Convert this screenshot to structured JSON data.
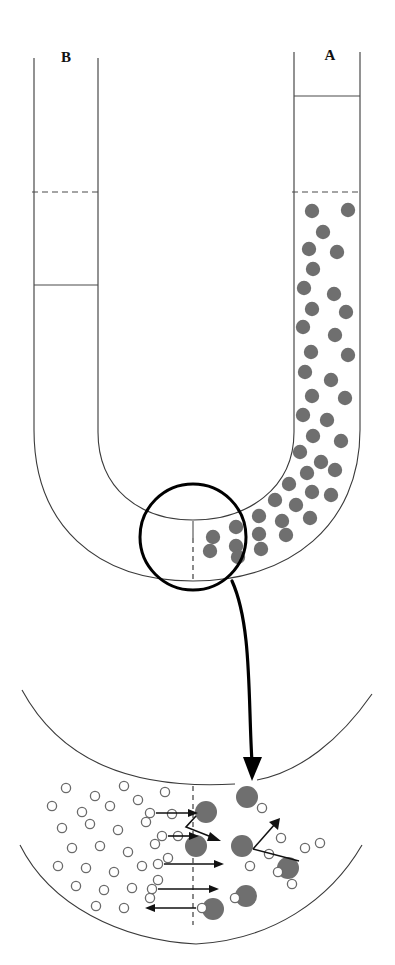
{
  "figure": {
    "type": "diagram",
    "background_color": "#ffffff",
    "line_color": "#3a3a3a",
    "solute_color": "#6f6f6f",
    "solvent_outline_color": "#6a6a6a",
    "callout_color": "#000000"
  },
  "labels": {
    "left_arm": "B",
    "right_arm": "A"
  },
  "tube": {
    "left_arm": {
      "name": "B",
      "outer_wall_x": 34,
      "inner_wall_x": 98,
      "top_y": 58,
      "contents": "pure solvent",
      "solid_level_y": 285,
      "dashed_level_y": 192
    },
    "right_arm": {
      "name": "A",
      "inner_wall_x": 294,
      "outer_wall_x": 360,
      "top_y": 55,
      "contents": "solution with solute",
      "solid_level_y": 96,
      "dashed_level_y": 192
    },
    "dashed_initial_level_y": 192,
    "membrane_x": 193
  },
  "callout": {
    "center_x": 193,
    "center_y": 537,
    "radius": 53,
    "stroke_width": 3
  },
  "detail": {
    "membrane_x": 193,
    "solvent_radius": 4.6,
    "solute_radius": 11,
    "left_side_contents": "solvent molecules (small open circles)",
    "right_side_contents": "solute particles (large filled circles) plus solvent"
  },
  "particles": {
    "solute_tube_a": [
      [
        312,
        211
      ],
      [
        348,
        210
      ],
      [
        323,
        232
      ],
      [
        309,
        249
      ],
      [
        337,
        252
      ],
      [
        313,
        269
      ],
      [
        304,
        288
      ],
      [
        334,
        294
      ],
      [
        312,
        309
      ],
      [
        346,
        312
      ],
      [
        303,
        327
      ],
      [
        335,
        335
      ],
      [
        311,
        352
      ],
      [
        348,
        355
      ],
      [
        305,
        372
      ],
      [
        331,
        380
      ],
      [
        312,
        396
      ],
      [
        345,
        398
      ],
      [
        303,
        415
      ],
      [
        327,
        420
      ],
      [
        313,
        436
      ],
      [
        341,
        441
      ],
      [
        300,
        452
      ],
      [
        321,
        462
      ],
      [
        307,
        473
      ],
      [
        335,
        470
      ],
      [
        289,
        484
      ],
      [
        312,
        492
      ],
      [
        275,
        500
      ],
      [
        296,
        505
      ],
      [
        331,
        495
      ],
      [
        259,
        516
      ],
      [
        282,
        521
      ],
      [
        310,
        518
      ],
      [
        236,
        527
      ],
      [
        259,
        534
      ],
      [
        286,
        535
      ],
      [
        213,
        537
      ],
      [
        236,
        546
      ],
      [
        261,
        549
      ],
      [
        210,
        551
      ],
      [
        238,
        557
      ]
    ],
    "solvent_detail_left": [
      [
        66,
        788
      ],
      [
        95,
        796
      ],
      [
        124,
        786
      ],
      [
        52,
        806
      ],
      [
        82,
        812
      ],
      [
        110,
        806
      ],
      [
        138,
        800
      ],
      [
        165,
        792
      ],
      [
        62,
        828
      ],
      [
        90,
        824
      ],
      [
        118,
        830
      ],
      [
        146,
        822
      ],
      [
        172,
        814
      ],
      [
        72,
        848
      ],
      [
        100,
        846
      ],
      [
        128,
        852
      ],
      [
        155,
        844
      ],
      [
        178,
        836
      ],
      [
        58,
        866
      ],
      [
        86,
        868
      ],
      [
        114,
        872
      ],
      [
        142,
        866
      ],
      [
        168,
        858
      ],
      [
        76,
        886
      ],
      [
        104,
        890
      ],
      [
        132,
        888
      ],
      [
        158,
        880
      ],
      [
        96,
        906
      ],
      [
        124,
        908
      ],
      [
        150,
        898
      ]
    ],
    "solvent_detail_right": [
      [
        262,
        808
      ],
      [
        281,
        838
      ],
      [
        269,
        854
      ],
      [
        305,
        848
      ],
      [
        320,
        843
      ],
      [
        250,
        866
      ],
      [
        278,
        872
      ],
      [
        235,
        898
      ],
      [
        292,
        884
      ]
    ],
    "solute_detail": [
      [
        206,
        812
      ],
      [
        247,
        797
      ],
      [
        196,
        846
      ],
      [
        242,
        846
      ],
      [
        288,
        868
      ],
      [
        246,
        896
      ],
      [
        213,
        909
      ]
    ]
  },
  "flow_arrows": [
    {
      "name": "solvent-flow-1",
      "from_x": 152,
      "to_x": 197,
      "y": 813,
      "direction": "right"
    },
    {
      "name": "solvent-deflect",
      "y": 825,
      "direction": "bent-right"
    },
    {
      "name": "solvent-flow-2",
      "from_x": 160,
      "to_x": 198,
      "y": 836,
      "direction": "right"
    },
    {
      "name": "solvent-flow-3",
      "from_x": 158,
      "to_x": 223,
      "y": 864,
      "direction": "right"
    },
    {
      "name": "solvent-flow-4",
      "from_x": 152,
      "to_x": 218,
      "y": 889,
      "direction": "right"
    },
    {
      "name": "solvent-backflow",
      "from_x": 200,
      "to_x": 145,
      "y": 908,
      "direction": "left"
    },
    {
      "name": "solute-bounce",
      "direction": "up-left-deflection"
    }
  ]
}
